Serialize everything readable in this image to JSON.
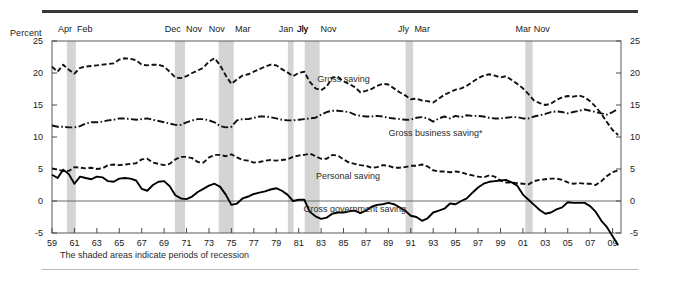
{
  "figure": {
    "percent_label": "Percent",
    "footnote": "The shaded areas indicate periods of recession"
  },
  "chart_data": {
    "type": "line",
    "title": "",
    "subtitle": "",
    "xlabel": "",
    "ylabel": "Percent",
    "ylim": [
      -5,
      25
    ],
    "yticks": [
      -5,
      0,
      5,
      10,
      15,
      20,
      25
    ],
    "ytick_labels": [
      "-5",
      "0",
      "5",
      "10",
      "15",
      "20",
      "25"
    ],
    "ytick_labels_right": [
      "-5",
      "0",
      "5",
      "10",
      "15",
      "20",
      "25"
    ],
    "xlim": [
      1959,
      2009.75
    ],
    "xticks": [
      1959,
      1961,
      1963,
      1965,
      1967,
      1969,
      1971,
      1973,
      1975,
      1977,
      1979,
      1981,
      1983,
      1985,
      1987,
      1989,
      1991,
      1993,
      1995,
      1997,
      1999,
      2001,
      2003,
      2005,
      2007,
      2009
    ],
    "xtick_labels": [
      "59",
      "61",
      "63",
      "65",
      "67",
      "69",
      "71",
      "73",
      "75",
      "77",
      "79",
      "81",
      "83",
      "85",
      "87",
      "89",
      "91",
      "93",
      "95",
      "97",
      "99",
      "01",
      "03",
      "05",
      "07",
      "09"
    ],
    "grid": false,
    "legend_position": "inline-annotations",
    "zero_line": 0,
    "annotations": [
      {
        "text": "Gross saving",
        "x": 1985.0,
        "y": 18.6
      },
      {
        "text": "Gross business saving*",
        "x": 1993.2,
        "y": 10.2
      },
      {
        "text": "Personal saving",
        "x": 1985.4,
        "y": 3.4
      },
      {
        "text": "Gross government saving",
        "x": 1986.0,
        "y": -1.7
      }
    ],
    "recessions": [
      {
        "peak_label": "Apr",
        "trough_label": "Feb",
        "start": 1960.33,
        "end": 1961.12
      },
      {
        "peak_label": "Dec",
        "trough_label": "Nov",
        "start": 1969.96,
        "end": 1970.87
      },
      {
        "peak_label": "Nov",
        "trough_label": "Mar",
        "start": 1973.87,
        "end": 1975.21
      },
      {
        "peak_label": "Jan",
        "trough_label": "Jly",
        "start": 1980.04,
        "end": 1980.54
      },
      {
        "peak_label": "Jly",
        "trough_label": "Nov",
        "start": 1981.54,
        "end": 1982.87
      },
      {
        "peak_label": "Jly",
        "trough_label": "Mar",
        "start": 1990.54,
        "end": 1991.21
      },
      {
        "peak_label": "Mar",
        "trough_label": "Nov",
        "start": 2001.21,
        "end": 2001.87
      }
    ],
    "x": [
      1959.0,
      1959.5,
      1960.0,
      1960.5,
      1961.0,
      1961.5,
      1962.0,
      1962.5,
      1963.0,
      1963.5,
      1964.0,
      1964.5,
      1965.0,
      1965.5,
      1966.0,
      1966.5,
      1967.0,
      1967.5,
      1968.0,
      1968.5,
      1969.0,
      1969.5,
      1970.0,
      1970.5,
      1971.0,
      1971.5,
      1972.0,
      1972.5,
      1973.0,
      1973.5,
      1974.0,
      1974.5,
      1975.0,
      1975.5,
      1976.0,
      1976.5,
      1977.0,
      1977.5,
      1978.0,
      1978.5,
      1979.0,
      1979.5,
      1980.0,
      1980.5,
      1981.0,
      1981.5,
      1982.0,
      1982.5,
      1983.0,
      1983.5,
      1984.0,
      1984.5,
      1985.0,
      1985.5,
      1986.0,
      1986.5,
      1987.0,
      1987.5,
      1988.0,
      1988.5,
      1989.0,
      1989.5,
      1990.0,
      1990.5,
      1991.0,
      1991.5,
      1992.0,
      1992.5,
      1993.0,
      1993.5,
      1994.0,
      1994.5,
      1995.0,
      1995.5,
      1996.0,
      1996.5,
      1997.0,
      1997.5,
      1998.0,
      1998.5,
      1999.0,
      1999.5,
      2000.0,
      2000.5,
      2001.0,
      2001.5,
      2002.0,
      2002.5,
      2003.0,
      2003.5,
      2004.0,
      2004.5,
      2005.0,
      2005.5,
      2006.0,
      2006.5,
      2007.0,
      2007.5,
      2008.0,
      2008.5,
      2009.0,
      2009.5
    ],
    "series": [
      {
        "name": "Gross saving",
        "style": "dashed",
        "color": "#111111",
        "values": [
          21.0,
          20.2,
          21.3,
          20.5,
          19.9,
          20.8,
          21.0,
          21.1,
          21.2,
          21.3,
          21.4,
          21.5,
          22.1,
          22.3,
          22.2,
          22.0,
          21.3,
          21.2,
          21.3,
          21.3,
          21.0,
          20.2,
          19.3,
          19.2,
          19.5,
          20.0,
          20.4,
          20.8,
          21.8,
          22.3,
          21.2,
          19.6,
          18.3,
          19.0,
          19.6,
          19.8,
          20.2,
          20.6,
          21.0,
          21.3,
          21.2,
          20.6,
          20.1,
          19.5,
          20.0,
          20.2,
          18.6,
          17.6,
          17.3,
          17.9,
          19.3,
          19.4,
          18.7,
          18.3,
          17.8,
          17.0,
          17.2,
          17.5,
          18.0,
          18.3,
          18.2,
          17.6,
          17.0,
          16.5,
          15.9,
          16.0,
          15.7,
          15.6,
          15.4,
          16.0,
          16.6,
          17.0,
          17.4,
          17.6,
          18.0,
          18.6,
          19.2,
          19.6,
          19.8,
          19.6,
          19.3,
          19.5,
          18.9,
          18.3,
          17.6,
          16.7,
          15.7,
          15.3,
          15.0,
          15.2,
          15.8,
          16.2,
          16.4,
          16.3,
          16.5,
          16.2,
          15.6,
          14.7,
          13.6,
          12.3,
          11.1,
          10.3
        ]
      },
      {
        "name": "Gross business saving*",
        "style": "dash-dot",
        "color": "#111111",
        "values": [
          11.8,
          11.6,
          11.6,
          11.5,
          11.5,
          11.7,
          12.1,
          12.3,
          12.3,
          12.4,
          12.6,
          12.7,
          12.9,
          12.9,
          12.8,
          12.7,
          12.8,
          12.9,
          12.7,
          12.5,
          12.3,
          12.1,
          11.9,
          11.9,
          12.3,
          12.6,
          12.8,
          12.8,
          12.6,
          12.3,
          11.7,
          11.5,
          11.6,
          12.6,
          12.8,
          12.8,
          13.0,
          13.2,
          13.2,
          13.1,
          12.9,
          12.7,
          12.6,
          12.6,
          12.7,
          12.8,
          12.9,
          13.0,
          13.5,
          13.9,
          14.1,
          14.1,
          14.0,
          13.9,
          13.5,
          13.3,
          13.2,
          13.2,
          13.3,
          13.2,
          13.0,
          12.9,
          12.8,
          12.7,
          12.7,
          13.0,
          13.1,
          12.9,
          12.4,
          12.9,
          13.2,
          12.9,
          13.3,
          13.1,
          13.4,
          13.3,
          13.3,
          13.2,
          13.0,
          12.9,
          12.9,
          13.0,
          13.1,
          13.1,
          12.9,
          12.9,
          13.2,
          13.4,
          13.6,
          13.9,
          14.0,
          13.9,
          13.7,
          13.9,
          14.1,
          14.3,
          14.1,
          13.9,
          13.7,
          13.5,
          13.9,
          14.4
        ]
      },
      {
        "name": "Personal saving",
        "style": "dashed",
        "color": "#111111",
        "values": [
          5.1,
          4.9,
          4.7,
          4.7,
          5.3,
          5.2,
          5.1,
          5.2,
          5.0,
          5.1,
          5.6,
          5.7,
          5.6,
          5.7,
          5.8,
          5.9,
          6.5,
          6.6,
          6.0,
          5.8,
          5.6,
          5.8,
          6.5,
          6.9,
          6.9,
          6.7,
          6.1,
          6.0,
          6.8,
          7.2,
          7.2,
          7.0,
          7.3,
          6.8,
          6.4,
          6.3,
          6.0,
          6.1,
          6.3,
          6.4,
          6.3,
          6.4,
          6.5,
          6.9,
          7.1,
          7.2,
          7.4,
          7.0,
          6.6,
          6.6,
          7.2,
          7.1,
          6.5,
          6.0,
          5.8,
          5.6,
          5.5,
          5.2,
          5.3,
          5.6,
          5.5,
          5.2,
          5.2,
          5.3,
          5.5,
          5.5,
          5.7,
          5.4,
          4.8,
          4.6,
          4.6,
          4.5,
          4.6,
          4.5,
          4.2,
          4.0,
          3.8,
          3.7,
          4.0,
          3.8,
          3.2,
          2.9,
          2.9,
          2.8,
          2.7,
          2.6,
          3.1,
          3.3,
          3.4,
          3.5,
          3.5,
          3.3,
          2.9,
          2.7,
          2.8,
          2.7,
          2.7,
          2.5,
          3.1,
          3.9,
          4.5,
          4.8
        ]
      },
      {
        "name": "Gross government saving",
        "style": "solid",
        "color": "#000000",
        "values": [
          4.1,
          3.6,
          4.9,
          4.2,
          2.7,
          3.8,
          3.6,
          3.4,
          3.8,
          3.7,
          3.1,
          3.0,
          3.5,
          3.6,
          3.5,
          3.2,
          1.9,
          1.6,
          2.5,
          3.0,
          3.1,
          2.3,
          0.9,
          0.4,
          0.3,
          0.7,
          1.4,
          1.9,
          2.4,
          2.7,
          2.2,
          1.0,
          -0.6,
          -0.4,
          0.4,
          0.7,
          1.1,
          1.3,
          1.5,
          1.8,
          2.0,
          1.6,
          1.0,
          0.0,
          0.2,
          0.2,
          -1.7,
          -2.4,
          -2.8,
          -2.6,
          -2.0,
          -1.8,
          -1.8,
          -1.6,
          -1.5,
          -1.9,
          -1.5,
          -0.9,
          -0.6,
          -0.5,
          -0.3,
          -0.5,
          -1.0,
          -1.5,
          -2.3,
          -2.5,
          -3.1,
          -2.7,
          -1.8,
          -1.5,
          -1.2,
          -0.4,
          -0.5,
          0.0,
          0.4,
          1.3,
          2.1,
          2.7,
          3.0,
          3.1,
          3.2,
          3.3,
          2.9,
          2.4,
          1.0,
          0.2,
          -0.6,
          -1.4,
          -2.0,
          -1.8,
          -1.3,
          -1.0,
          -0.2,
          -0.3,
          -0.3,
          -0.3,
          -0.8,
          -1.7,
          -3.1,
          -4.1,
          -5.5,
          -6.9
        ]
      }
    ]
  }
}
